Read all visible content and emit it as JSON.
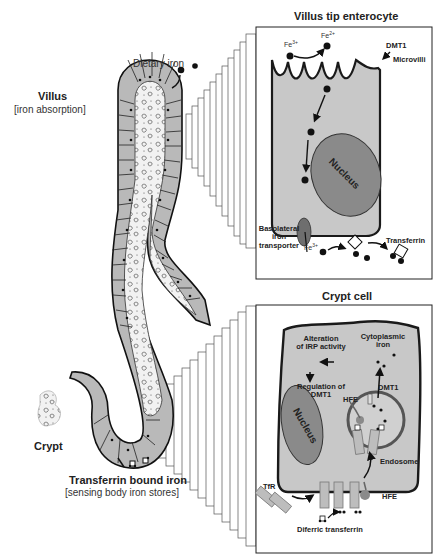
{
  "figure": {
    "left_panel": {
      "villus_title": "Villus",
      "villus_subtitle": "[iron absorption]",
      "dietary_iron": "Dietary iron",
      "crypt": "Crypt",
      "transferrin_title": "Transferrin bound iron",
      "transferrin_subtitle": "[sensing body iron stores]"
    },
    "villus_tip_panel": {
      "title": "Villus tip enterocyte",
      "fe3": "Fe",
      "fe3_sup": "3+",
      "fe2": "Fe",
      "fe2_sup": "2+",
      "dmt1": "DMT1",
      "microvilli": "Microvilli",
      "nucleus": "Nucleus",
      "basolateral_1": "Basolateral",
      "basolateral_2": "iron",
      "basolateral_3": "transporter",
      "fe3_out": "Fe",
      "fe3_out_sup": "3+",
      "transferrin": "Transferrin"
    },
    "crypt_cell_panel": {
      "title": "Crypt cell",
      "alteration_1": "Alteration",
      "alteration_2": "of IRP activity",
      "regulation_1": "Regulation of",
      "regulation_2": "DMT1",
      "cytoplasmic_1": "Cytoplasmic",
      "cytoplasmic_2": "iron",
      "dmt1": "DMT1",
      "hfe_top": "HFE",
      "nucleus": "Nucleus",
      "endosome": "Endosome",
      "tfr": "TfR",
      "hfe_bottom": "HFE",
      "diferric": "Diferric transferrin"
    },
    "colors": {
      "cell_fill": "#c8c8c8",
      "nucleus_fill": "#8a8a8a",
      "outline": "#1a1a1a",
      "transporter": "#6e6e6e",
      "receptor": "#bdbdbd",
      "background": "#ffffff"
    }
  }
}
